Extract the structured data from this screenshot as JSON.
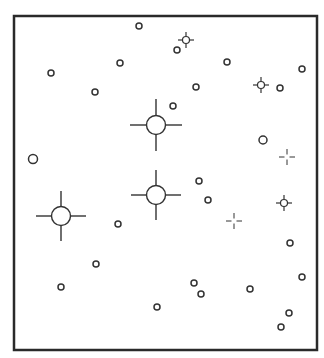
{
  "diagram": {
    "type": "star-field",
    "frame": {
      "x": 14,
      "y": 16,
      "width": 303,
      "height": 334,
      "stroke": "#2a2a2a",
      "stroke_width": 2.5
    },
    "colors": {
      "stroke": "#333333",
      "background": "#ffffff",
      "fill": "#ffffff"
    },
    "bright_stars": [
      {
        "cx": 156,
        "cy": 125,
        "r": 9.5,
        "arm": 26
      },
      {
        "cx": 156,
        "cy": 195,
        "r": 9.5,
        "arm": 25
      },
      {
        "cx": 61,
        "cy": 216,
        "r": 9.5,
        "arm": 25
      }
    ],
    "medium_stars": [
      {
        "cx": 186,
        "cy": 40,
        "r": 3.5,
        "arm": 8
      },
      {
        "cx": 261,
        "cy": 85,
        "r": 3.5,
        "arm": 8
      },
      {
        "cx": 284,
        "cy": 203,
        "r": 3.5,
        "arm": 8
      }
    ],
    "faint_crosses": [
      {
        "cx": 287,
        "cy": 157,
        "gap": 2.5,
        "arm": 8
      },
      {
        "cx": 234,
        "cy": 221,
        "gap": 2.5,
        "arm": 8
      }
    ],
    "circles": [
      {
        "cx": 139,
        "cy": 26,
        "r": 3
      },
      {
        "cx": 177,
        "cy": 50,
        "r": 3
      },
      {
        "cx": 120,
        "cy": 63,
        "r": 3
      },
      {
        "cx": 227,
        "cy": 62,
        "r": 3
      },
      {
        "cx": 51,
        "cy": 73,
        "r": 3
      },
      {
        "cx": 302,
        "cy": 69,
        "r": 3
      },
      {
        "cx": 95,
        "cy": 92,
        "r": 3
      },
      {
        "cx": 196,
        "cy": 87,
        "r": 3
      },
      {
        "cx": 280,
        "cy": 88,
        "r": 3
      },
      {
        "cx": 173,
        "cy": 106,
        "r": 3
      },
      {
        "cx": 263,
        "cy": 140,
        "r": 4
      },
      {
        "cx": 33,
        "cy": 159,
        "r": 4.5
      },
      {
        "cx": 199,
        "cy": 181,
        "r": 3
      },
      {
        "cx": 208,
        "cy": 200,
        "r": 3
      },
      {
        "cx": 118,
        "cy": 224,
        "r": 3
      },
      {
        "cx": 290,
        "cy": 243,
        "r": 3
      },
      {
        "cx": 96,
        "cy": 264,
        "r": 3
      },
      {
        "cx": 302,
        "cy": 277,
        "r": 3
      },
      {
        "cx": 194,
        "cy": 283,
        "r": 3
      },
      {
        "cx": 61,
        "cy": 287,
        "r": 3
      },
      {
        "cx": 250,
        "cy": 289,
        "r": 3
      },
      {
        "cx": 201,
        "cy": 294,
        "r": 3
      },
      {
        "cx": 157,
        "cy": 307,
        "r": 3
      },
      {
        "cx": 289,
        "cy": 313,
        "r": 3
      },
      {
        "cx": 281,
        "cy": 327,
        "r": 3
      }
    ]
  }
}
